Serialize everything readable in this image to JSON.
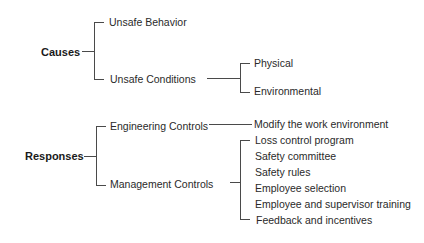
{
  "diagram": {
    "type": "tree",
    "causes": {
      "label": "Causes",
      "children": [
        {
          "label": "Unsafe Behavior"
        },
        {
          "label": "Unsafe Conditions",
          "children": [
            {
              "label": "Physical"
            },
            {
              "label": "Environmental"
            }
          ]
        }
      ]
    },
    "responses": {
      "label": "Responses",
      "children": [
        {
          "label": "Engineering Controls",
          "children": [
            {
              "label": "Modify the work environment"
            }
          ]
        },
        {
          "label": "Management Controls",
          "children": [
            {
              "label": "Loss control program"
            },
            {
              "label": "Safety committee"
            },
            {
              "label": "Safety rules"
            },
            {
              "label": "Employee selection"
            },
            {
              "label": "Employee and supervisor training"
            },
            {
              "label": "Feedback and incentives"
            }
          ]
        }
      ]
    }
  }
}
